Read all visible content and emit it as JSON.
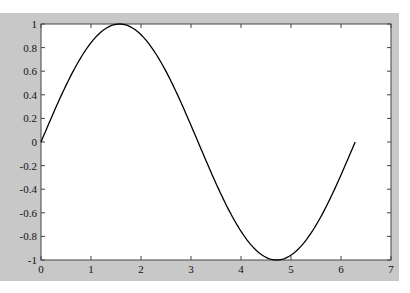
{
  "chart_data": {
    "type": "line",
    "title": "",
    "xlabel": "",
    "ylabel": "",
    "xlim": [
      0,
      7
    ],
    "ylim": [
      -1,
      1
    ],
    "grid": false,
    "x_ticks": [
      "0",
      "1",
      "2",
      "3",
      "4",
      "5",
      "6",
      "7"
    ],
    "y_ticks": [
      "-1",
      "-0.8",
      "-0.6",
      "-0.4",
      "-0.2",
      "0",
      "0.2",
      "0.4",
      "0.6",
      "0.8",
      "1"
    ],
    "series": [
      {
        "name": "sin(x)",
        "function": "sin(x)",
        "x_range": [
          0,
          6.2832
        ],
        "x": [
          0,
          0.5,
          1.0,
          1.5708,
          2.0,
          2.5,
          3.0,
          3.1416,
          3.5,
          4.0,
          4.7124,
          5.0,
          5.5,
          6.0,
          6.2
        ],
        "values": [
          0,
          0.479,
          0.841,
          1.0,
          0.909,
          0.598,
          0.141,
          0.0,
          -0.351,
          -0.757,
          -1.0,
          -0.959,
          -0.706,
          -0.279,
          -0.083
        ],
        "color": "#000000"
      }
    ]
  },
  "colors": {
    "figure_background": "#c8c8c8",
    "axes_background": "#ffffff",
    "line": "#000000"
  }
}
